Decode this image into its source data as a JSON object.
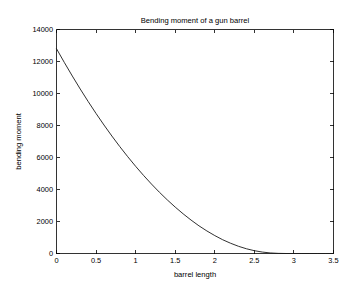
{
  "figure": {
    "background_color": "#ffffff",
    "axes_color": "#000000",
    "line_color": "#1a1a1a"
  },
  "chart_data": {
    "type": "line",
    "title": "Bending moment of a gun barrel",
    "xlabel": "barrel length",
    "ylabel": "bending moment",
    "xlim": [
      0,
      3.5
    ],
    "ylim": [
      0,
      14000
    ],
    "grid": false,
    "legend": null,
    "xticks": [
      0,
      0.5,
      1,
      1.5,
      2,
      2.5,
      3,
      3.5
    ],
    "xtick_labels": [
      "0",
      "0.5",
      "1",
      "1.5",
      "2",
      "2.5",
      "3",
      "3.5"
    ],
    "yticks": [
      0,
      2000,
      4000,
      6000,
      8000,
      10000,
      12000,
      14000
    ],
    "ytick_labels": [
      "0",
      "2000",
      "4000",
      "6000",
      "8000",
      "10000",
      "12000",
      "14000"
    ],
    "series": [
      {
        "name": "bending moment",
        "color": "#1a1a1a",
        "x": [
          0,
          0.1,
          0.2,
          0.3,
          0.4,
          0.5,
          0.6,
          0.7,
          0.8,
          0.9,
          1.0,
          1.1,
          1.2,
          1.3,
          1.4,
          1.5,
          1.6,
          1.7,
          1.8,
          1.9,
          2.0,
          2.1,
          2.2,
          2.3,
          2.4,
          2.5,
          2.6,
          2.7,
          2.8,
          2.9,
          3.0,
          3.1,
          3.2,
          3.3,
          3.4,
          3.5
        ],
        "y": [
          12800,
          11930,
          11090,
          10280,
          9500,
          8750,
          8030,
          7340,
          6680,
          6050,
          5450,
          4880,
          4340,
          3830,
          3350,
          2900,
          2480,
          2090,
          1730,
          1410,
          1120,
          860,
          640,
          450,
          295,
          175,
          90,
          35,
          8,
          0,
          0,
          0,
          0,
          0,
          0,
          0
        ]
      }
    ]
  }
}
